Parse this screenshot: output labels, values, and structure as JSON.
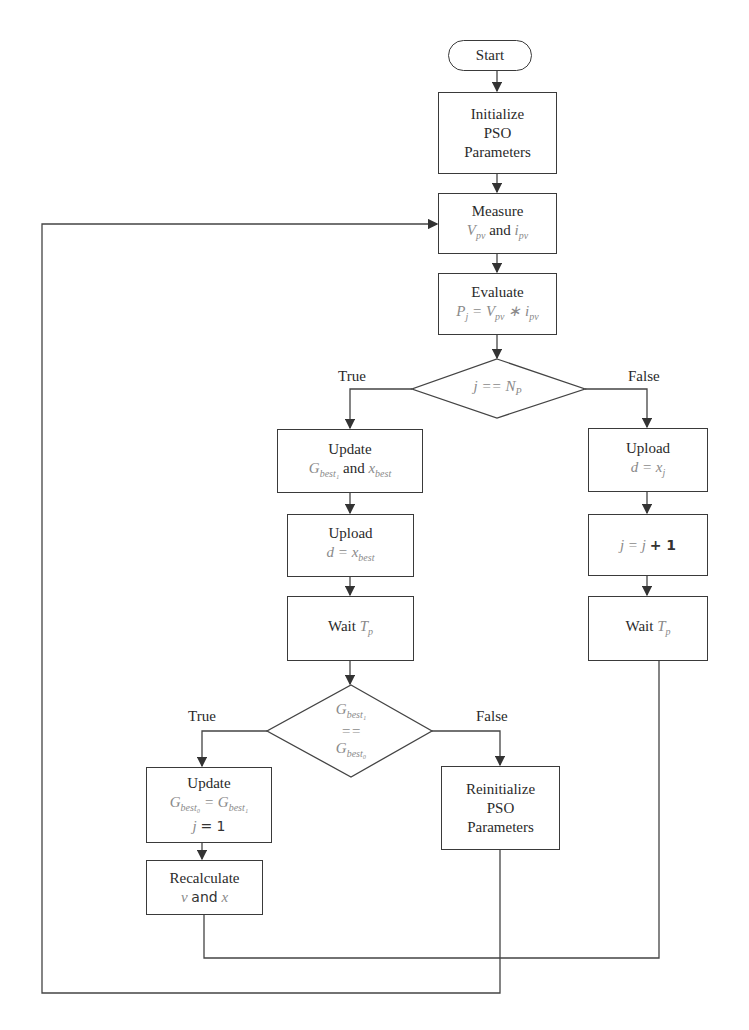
{
  "start": {
    "label": "Start"
  },
  "initialize": {
    "line1": "Initialize",
    "line2": "PSO",
    "line3": "Parameters"
  },
  "measure": {
    "title": "Measure",
    "var1": "V",
    "var1_sub": "pv",
    "conj": "and",
    "var2": "i",
    "var2_sub": "pv"
  },
  "evaluate": {
    "title": "Evaluate",
    "expr": "P",
    "expr_sub": "j",
    "eq": "=",
    "v": "V",
    "v_sub": "pv",
    "op": "∗",
    "i": "i",
    "i_sub": "pv"
  },
  "decision1": {
    "text": "j == N",
    "text_sub": "P",
    "true_label": "True",
    "false_label": "False"
  },
  "update_gbest1": {
    "title": "Update",
    "g": "G",
    "g_sub": "best₁",
    "conj": "and",
    "x": "x",
    "x_sub": "best"
  },
  "upload_xbest": {
    "title": "Upload",
    "expr": "d = x",
    "expr_sub": "best"
  },
  "wait_left": {
    "title": "Wait",
    "var": "T",
    "var_sub": "p"
  },
  "upload_xj": {
    "title": "Upload",
    "expr": "d = x",
    "expr_sub": "j"
  },
  "increment": {
    "lhs": "j = j ",
    "rhs": "+ 1"
  },
  "wait_right": {
    "title": "Wait",
    "var": "T",
    "var_sub": "p"
  },
  "decision2": {
    "line1": "G",
    "line1_sub": "best₁",
    "line2": "==",
    "line3": "G",
    "line3_sub": "best₀",
    "true_label": "True",
    "false_label": "False"
  },
  "update_gbest0": {
    "title": "Update",
    "lhs": "G",
    "lhs_sub": "best₀",
    "eq": "=",
    "rhs": "G",
    "rhs_sub": "best₁",
    "line3_var": "j",
    "line3_rest": "= 1"
  },
  "reinitialize": {
    "line1": "Reinitialize",
    "line2": "PSO",
    "line3": "Parameters"
  },
  "recalculate": {
    "title": "Recalculate",
    "v": "v",
    "conj": "and",
    "x": "x"
  },
  "colors": {
    "stroke": "#3a3a3a",
    "math_text": "#8a8a8a",
    "text": "#2a2a2a"
  }
}
